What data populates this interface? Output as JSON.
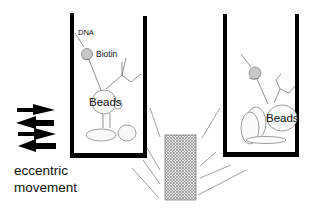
{
  "labels": {
    "dna": "DNA",
    "biotin": "Biotin",
    "beads_left": "Beads",
    "beads_right": "Beads",
    "caption_line1": "eccentric",
    "caption_line2": "movement"
  },
  "icons": {
    "arrows": [
      "arrow-right",
      "arrow-left",
      "arrow-right",
      "arrow-left"
    ],
    "vibration_source": "crosshatched-block"
  },
  "colors": {
    "wall": "#000000",
    "line": "#777777",
    "biotin_fill": "#c8c8c8",
    "hatch": "#9a9a9a",
    "text": "#111111"
  }
}
